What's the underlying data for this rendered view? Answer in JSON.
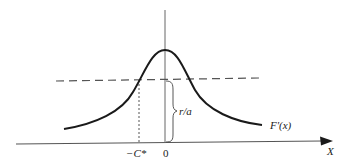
{
  "diagram": {
    "type": "function-plot",
    "curve_label": "F'(x)",
    "x_axis_label": "X",
    "origin_label": "0",
    "threshold_point_label": "−C*",
    "brace_label": "r/a",
    "curve_shape": "bell-shaped, peak at x=0",
    "dashed_line": "horizontal level r/a",
    "dotted_line": "vertical drop from curve/dashed-line intersection at −C* to x-axis"
  },
  "colors": {
    "background": "#ffffff",
    "curve": "#1a1a1a",
    "axes": "#555555",
    "dashed": "#555555",
    "text": "#222222"
  }
}
